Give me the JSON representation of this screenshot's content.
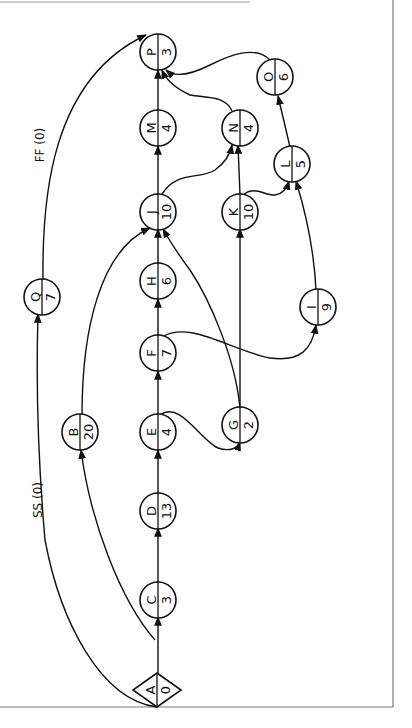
{
  "diagram": {
    "type": "precedence-network",
    "orientation": "rotated-90-ccw",
    "start_node": "A",
    "end_node": "P",
    "nodes": [
      {
        "id": "A",
        "label": "A",
        "duration": "0",
        "shape": "diamond",
        "x": 157,
        "y": 690
      },
      {
        "id": "C",
        "label": "C",
        "duration": "3",
        "shape": "ellipse",
        "x": 158,
        "y": 600
      },
      {
        "id": "D",
        "label": "D",
        "duration": "13",
        "shape": "ellipse",
        "x": 158,
        "y": 511
      },
      {
        "id": "E",
        "label": "E",
        "duration": "4",
        "shape": "ellipse",
        "x": 158,
        "y": 432
      },
      {
        "id": "B",
        "label": "B",
        "duration": "20",
        "shape": "ellipse",
        "x": 80,
        "y": 432
      },
      {
        "id": "F",
        "label": "F",
        "duration": "7",
        "shape": "ellipse",
        "x": 158,
        "y": 353
      },
      {
        "id": "G",
        "label": "G",
        "duration": "2",
        "shape": "ellipse",
        "x": 240,
        "y": 425
      },
      {
        "id": "H",
        "label": "H",
        "duration": "6",
        "shape": "ellipse",
        "x": 158,
        "y": 281
      },
      {
        "id": "Q",
        "label": "Q",
        "duration": "7",
        "shape": "ellipse",
        "x": 42,
        "y": 297
      },
      {
        "id": "I",
        "label": "I",
        "duration": "9",
        "shape": "ellipse",
        "x": 318,
        "y": 307
      },
      {
        "id": "J",
        "label": "J",
        "duration": "10",
        "shape": "ellipse",
        "x": 158,
        "y": 212
      },
      {
        "id": "K",
        "label": "K",
        "duration": "10",
        "shape": "ellipse",
        "x": 240,
        "y": 212
      },
      {
        "id": "L",
        "label": "L",
        "duration": "5",
        "shape": "ellipse",
        "x": 292,
        "y": 164
      },
      {
        "id": "M",
        "label": "M",
        "duration": "4",
        "shape": "ellipse",
        "x": 158,
        "y": 128
      },
      {
        "id": "N",
        "label": "N",
        "duration": "4",
        "shape": "ellipse",
        "x": 240,
        "y": 128
      },
      {
        "id": "O",
        "label": "O",
        "duration": "6",
        "shape": "ellipse",
        "x": 275,
        "y": 77
      },
      {
        "id": "P",
        "label": "P",
        "duration": "3",
        "shape": "ellipse",
        "x": 158,
        "y": 52
      }
    ],
    "edges": [
      {
        "from": "A",
        "to": "C",
        "label": ""
      },
      {
        "from": "C",
        "to": "D",
        "label": ""
      },
      {
        "from": "D",
        "to": "E",
        "label": ""
      },
      {
        "from": "E",
        "to": "F",
        "label": ""
      },
      {
        "from": "F",
        "to": "H",
        "label": ""
      },
      {
        "from": "H",
        "to": "J",
        "label": ""
      },
      {
        "from": "J",
        "to": "M",
        "label": ""
      },
      {
        "from": "M",
        "to": "P",
        "label": ""
      },
      {
        "from": "A",
        "to": "B",
        "label": ""
      },
      {
        "from": "B",
        "to": "J",
        "label": ""
      },
      {
        "from": "A",
        "to": "Q",
        "label": "SS (0)"
      },
      {
        "from": "Q",
        "to": "P",
        "label": "FF (0)"
      },
      {
        "from": "E",
        "to": "G",
        "label": ""
      },
      {
        "from": "G",
        "to": "J",
        "label": ""
      },
      {
        "from": "G",
        "to": "K",
        "label": ""
      },
      {
        "from": "F",
        "to": "I",
        "label": ""
      },
      {
        "from": "I",
        "to": "L",
        "label": ""
      },
      {
        "from": "K",
        "to": "L",
        "label": ""
      },
      {
        "from": "K",
        "to": "N",
        "label": ""
      },
      {
        "from": "J",
        "to": "N",
        "label": ""
      },
      {
        "from": "N",
        "to": "P",
        "label": ""
      },
      {
        "from": "L",
        "to": "O",
        "label": ""
      },
      {
        "from": "O",
        "to": "P",
        "label": ""
      }
    ],
    "edge_labels": {
      "ss": "SS (0)",
      "ff": "FF (0)"
    }
  }
}
